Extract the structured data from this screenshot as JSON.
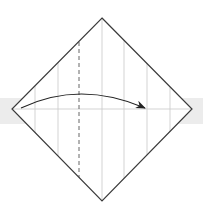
{
  "diagram": {
    "type": "origami-fold-step",
    "colors": {
      "background": "#ffffff",
      "band": "#ececec",
      "outline": "#3a3a3a",
      "crease": "#c8c8c8",
      "valley_line": "#555555",
      "arrow": "#222222"
    },
    "band": {
      "top": 98,
      "height": 26
    },
    "diamond": {
      "top": [
        102,
        18
      ],
      "right": [
        192,
        109
      ],
      "bottom": [
        102,
        201
      ],
      "left": [
        12,
        109
      ]
    },
    "creases_x": [
      35,
      58,
      102,
      124,
      147,
      170
    ],
    "horizontal_crease_y": 109,
    "valley_fold_x": 79,
    "arrow": {
      "from": [
        21,
        108
      ],
      "control": [
        80,
        80
      ],
      "to": [
        145,
        108
      ],
      "label": "fold-right"
    }
  }
}
